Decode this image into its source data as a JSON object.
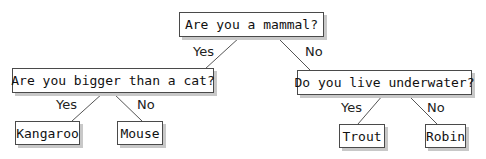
{
  "tree": {
    "root": {
      "question": "Are you a mammal?"
    },
    "left": {
      "question": "Are you bigger than a cat?"
    },
    "right": {
      "question": "Do you live underwater?"
    },
    "leaves": [
      "Kangaroo",
      "Mouse",
      "Trout",
      "Robin"
    ],
    "edges": {
      "root_yes": "Yes",
      "root_no": "No",
      "left_yes": "Yes",
      "left_no": "No",
      "right_yes": "Yes",
      "right_no": "No"
    }
  },
  "colors": {
    "border": "#4a4a4a",
    "shadow": "#c8c8c8",
    "line": "#555555"
  }
}
